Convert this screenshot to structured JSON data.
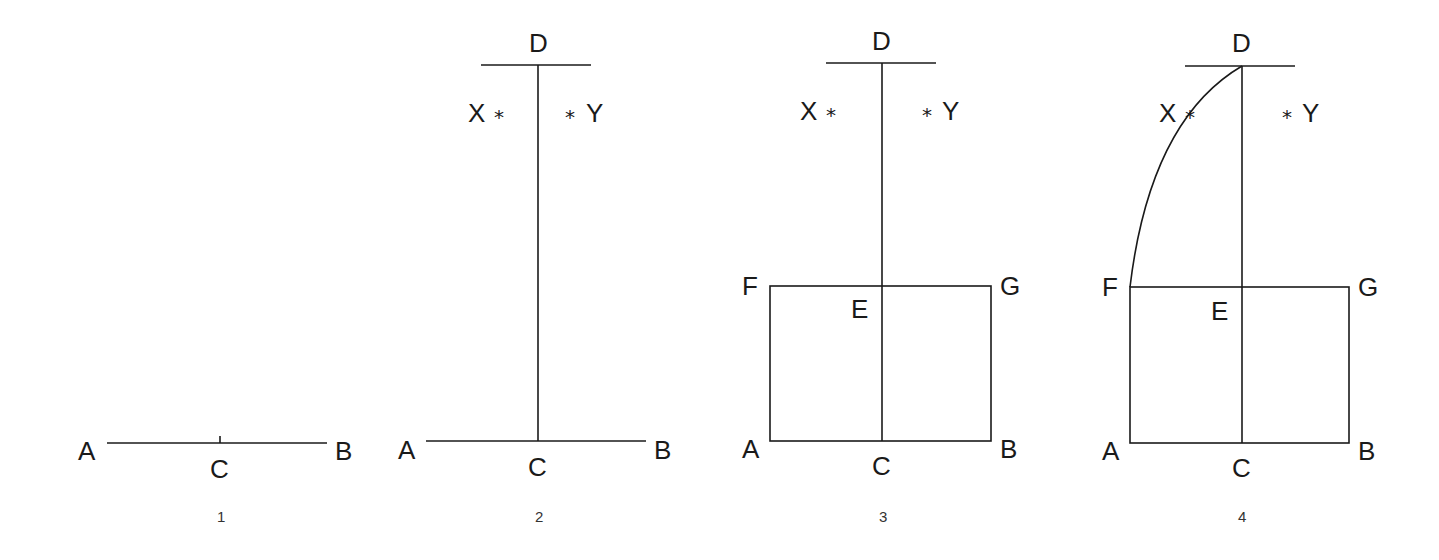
{
  "diagram": {
    "colors": {
      "line": "#1a1a1a",
      "background": "#ffffff"
    },
    "steps": [
      {
        "number": "1",
        "labels": {
          "A": "A",
          "B": "B",
          "C": "C"
        }
      },
      {
        "number": "2",
        "labels": {
          "A": "A",
          "B": "B",
          "C": "C",
          "D": "D",
          "X": "X",
          "Y": "Y",
          "asterisk": "*"
        }
      },
      {
        "number": "3",
        "labels": {
          "A": "A",
          "B": "B",
          "C": "C",
          "D": "D",
          "E": "E",
          "F": "F",
          "G": "G",
          "X": "X",
          "Y": "Y",
          "asterisk": "*"
        }
      },
      {
        "number": "4",
        "labels": {
          "A": "A",
          "B": "B",
          "C": "C",
          "D": "D",
          "E": "E",
          "F": "F",
          "G": "G",
          "X": "X",
          "Y": "Y",
          "asterisk": "*"
        }
      }
    ]
  }
}
